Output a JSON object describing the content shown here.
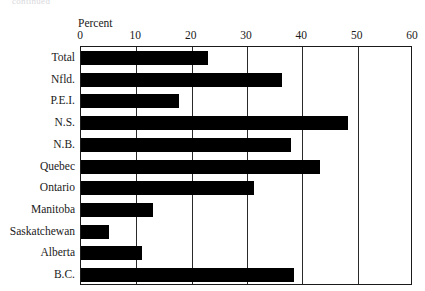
{
  "clipped_header_text": "continued",
  "chart_data": {
    "type": "bar",
    "orientation": "horizontal",
    "title": "",
    "xlabel": "Percent",
    "ylabel": "",
    "xlim": [
      0,
      60
    ],
    "xticks": [
      0,
      10,
      20,
      30,
      40,
      50,
      60
    ],
    "xtick_labels": [
      "0",
      "10",
      "20",
      "30",
      "40",
      "50",
      "60"
    ],
    "grid": true,
    "grid_axis": "x",
    "legend": false,
    "bar_color": "#000000",
    "frame_color": "#1a1a1a",
    "categories": [
      "Total",
      "Nfld.",
      "P.E.I.",
      "N.S.",
      "N.B.",
      "Quebec",
      "Ontario",
      "Manitoba",
      "Saskatchewan",
      "Alberta",
      "B.C."
    ],
    "values": [
      22.9,
      36.4,
      17.7,
      48.3,
      38.0,
      43.2,
      31.3,
      13.0,
      5.0,
      11.0,
      38.5
    ]
  }
}
